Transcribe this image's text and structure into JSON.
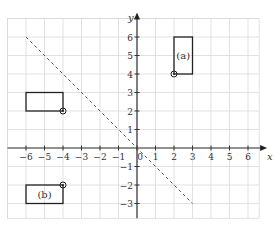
{
  "chart_data": {
    "type": "diagram",
    "title": "",
    "xlabel": "x",
    "ylabel": "y",
    "xlim": [
      -7,
      6.6
    ],
    "ylim": [
      -3.8,
      7
    ],
    "grid": true,
    "x_ticks": [
      -6,
      -5,
      -4,
      -3,
      -2,
      -1,
      0,
      1,
      2,
      3,
      4,
      5,
      6
    ],
    "x_tick_labels": [
      "−6",
      "−5",
      "−4",
      "−3",
      "−2",
      "−1",
      "0",
      "1",
      "2",
      "3",
      "4",
      "5",
      "6"
    ],
    "y_ticks": [
      -3,
      -2,
      -1,
      1,
      2,
      3,
      4,
      5,
      6
    ],
    "y_tick_labels": [
      "−3",
      "−2",
      "−1",
      "1",
      "2",
      "3",
      "4",
      "5",
      "6"
    ],
    "dashed_line": {
      "from": [
        -6,
        6
      ],
      "to": [
        3,
        -3
      ],
      "style": "dashed"
    },
    "rectangles": [
      {
        "label": "(a)",
        "x": 2,
        "y": 4,
        "width": 1,
        "height": 2,
        "marked_corner": [
          2,
          4
        ]
      },
      {
        "label": "",
        "x": -6,
        "y": 2,
        "width": 2,
        "height": 1,
        "marked_corner": [
          -4,
          2
        ]
      },
      {
        "label": "(b)",
        "x": -6,
        "y": -3,
        "width": 2,
        "height": 1,
        "marked_corner": [
          -4,
          -2
        ]
      }
    ]
  }
}
